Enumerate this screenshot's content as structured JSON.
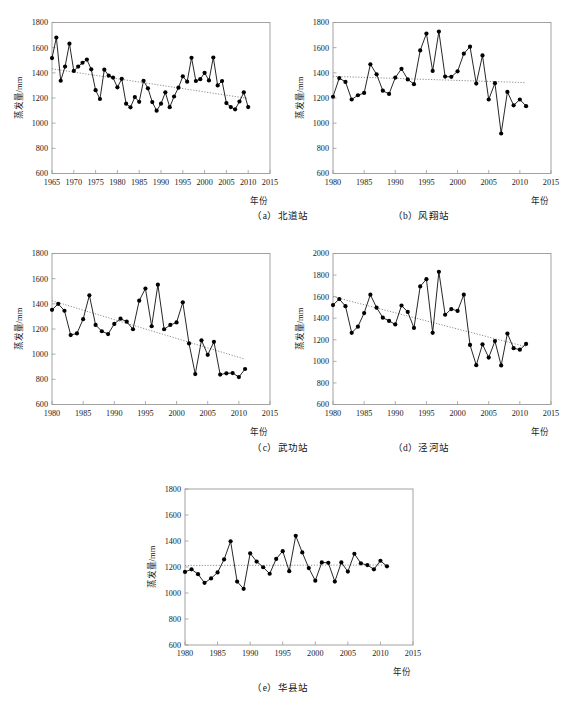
{
  "figure": {
    "axis_label_y": "蒸发量/mm",
    "axis_label_x": "年份",
    "marker_color": "#000000",
    "line_color": "#000000",
    "trend_color": "#808080",
    "axis_color": "#999999"
  },
  "captions": {
    "a": "（a）北道站",
    "b": "（b）风翔站",
    "c": "（c）武功站",
    "d": "（d）泾河站",
    "e": "（e）华县站"
  },
  "chart_data": [
    {
      "id": "a",
      "type": "line",
      "title": "（a）北道站",
      "station": "北道站",
      "xlabel": "年份",
      "ylabel": "蒸发量/mm",
      "xlim": [
        1965,
        2015
      ],
      "ylim": [
        600,
        1800
      ],
      "xticks": [
        1965,
        1970,
        1975,
        1980,
        1985,
        1990,
        1995,
        2000,
        2005,
        2010,
        2015
      ],
      "yticks": [
        600,
        800,
        1000,
        1200,
        1400,
        1600,
        1800
      ],
      "grid": false,
      "legend": "none",
      "trendline": {
        "type": "linear",
        "x": [
          1965,
          2010
        ],
        "y": [
          1432,
          1196
        ]
      },
      "x": [
        1965,
        1966,
        1967,
        1968,
        1969,
        1970,
        1971,
        1972,
        1973,
        1974,
        1975,
        1976,
        1977,
        1978,
        1979,
        1980,
        1981,
        1982,
        1983,
        1984,
        1985,
        1986,
        1987,
        1988,
        1989,
        1990,
        1991,
        1992,
        1993,
        1994,
        1995,
        1996,
        1997,
        1998,
        1999,
        2000,
        2001,
        2002,
        2003,
        2004,
        2005,
        2006,
        2007,
        2008,
        2009,
        2010
      ],
      "values": [
        1517,
        1680,
        1337,
        1450,
        1632,
        1415,
        1450,
        1480,
        1505,
        1428,
        1262,
        1192,
        1425,
        1378,
        1362,
        1285,
        1352,
        1155,
        1126,
        1207,
        1170,
        1337,
        1277,
        1168,
        1099,
        1155,
        1245,
        1127,
        1212,
        1282,
        1372,
        1330,
        1520,
        1335,
        1350,
        1400,
        1340,
        1522,
        1300,
        1335,
        1160,
        1128,
        1110,
        1172,
        1245,
        1128
      ]
    },
    {
      "id": "b",
      "type": "line",
      "title": "（b）风翔站",
      "station": "风翔站",
      "xlabel": "年份",
      "ylabel": "蒸发量/mm",
      "xlim": [
        1980,
        2015
      ],
      "ylim": [
        600,
        1800
      ],
      "xticks": [
        1980,
        1985,
        1990,
        1995,
        2000,
        2005,
        2010,
        2015
      ],
      "yticks": [
        600,
        800,
        1000,
        1200,
        1400,
        1600,
        1800
      ],
      "grid": false,
      "legend": "none",
      "trendline": {
        "type": "linear",
        "x": [
          1980,
          2011
        ],
        "y": [
          1372,
          1322
        ]
      },
      "x": [
        1980,
        1981,
        1982,
        1983,
        1984,
        1985,
        1986,
        1987,
        1988,
        1989,
        1990,
        1991,
        1992,
        1993,
        1994,
        1995,
        1996,
        1997,
        1998,
        1999,
        2000,
        2001,
        2002,
        2003,
        2004,
        2005,
        2006,
        2007,
        2008,
        2009,
        2010,
        2011
      ],
      "values": [
        1210,
        1358,
        1328,
        1188,
        1222,
        1240,
        1468,
        1388,
        1258,
        1232,
        1362,
        1432,
        1348,
        1310,
        1578,
        1712,
        1415,
        1728,
        1370,
        1368,
        1412,
        1552,
        1608,
        1315,
        1538,
        1188,
        1318,
        918,
        1248,
        1142,
        1188,
        1135
      ]
    },
    {
      "id": "c",
      "type": "line",
      "title": "（c）武功站",
      "station": "武功站",
      "xlabel": "年份",
      "ylabel": "蒸发量/mm",
      "xlim": [
        1980,
        2015
      ],
      "ylim": [
        600,
        1800
      ],
      "xticks": [
        1980,
        1985,
        1990,
        1995,
        2000,
        2005,
        2010,
        2015
      ],
      "yticks": [
        600,
        800,
        1000,
        1200,
        1400,
        1600,
        1800
      ],
      "grid": false,
      "legend": "none",
      "trendline": {
        "type": "linear",
        "x": [
          1980,
          2011
        ],
        "y": [
          1425,
          960
        ]
      },
      "x": [
        1980,
        1981,
        1982,
        1983,
        1984,
        1985,
        1986,
        1987,
        1988,
        1989,
        1990,
        1991,
        1992,
        1993,
        1994,
        1995,
        1996,
        1997,
        1998,
        1999,
        2000,
        2001,
        2002,
        2003,
        2004,
        2005,
        2006,
        2007,
        2008,
        2009,
        2010
      ],
      "values": [
        1352,
        1400,
        1345,
        1152,
        1165,
        1278,
        1468,
        1232,
        1182,
        1160,
        1240,
        1282,
        1258,
        1198,
        1425,
        1522,
        1222,
        1552,
        1198,
        1232,
        1252,
        1412,
        1085,
        842,
        1110,
        995,
        1098,
        838,
        848,
        850,
        818
      ],
      "extra_points": [
        {
          "x": 2011,
          "y": 882
        }
      ]
    },
    {
      "id": "d",
      "type": "line",
      "title": "（d）泾河站",
      "station": "泾河站",
      "xlabel": "年份",
      "ylabel": "蒸发量/mm",
      "xlim": [
        1980,
        2015
      ],
      "ylim": [
        600,
        2000
      ],
      "xticks": [
        1980,
        1985,
        1990,
        1995,
        2000,
        2005,
        2010,
        2015
      ],
      "yticks": [
        600,
        800,
        1000,
        1200,
        1400,
        1600,
        1800,
        2000
      ],
      "grid": false,
      "legend": "none",
      "trendline": {
        "type": "linear",
        "x": [
          1980,
          2011
        ],
        "y": [
          1600,
          1135
        ]
      },
      "x": [
        1980,
        1981,
        1982,
        1983,
        1984,
        1985,
        1986,
        1987,
        1988,
        1989,
        1990,
        1991,
        1992,
        1993,
        1994,
        1995,
        1996,
        1997,
        1998,
        1999,
        2000,
        2001,
        2002,
        2003,
        2004,
        2005,
        2006,
        2007,
        2008,
        2009,
        2010,
        2011
      ],
      "values": [
        1522,
        1578,
        1512,
        1265,
        1322,
        1448,
        1618,
        1498,
        1405,
        1375,
        1342,
        1518,
        1458,
        1310,
        1695,
        1762,
        1265,
        1830,
        1432,
        1485,
        1468,
        1618,
        1152,
        965,
        1158,
        1035,
        1188,
        962,
        1258,
        1122,
        1108,
        1162
      ]
    },
    {
      "id": "e",
      "type": "line",
      "title": "（e）华县站",
      "station": "华县站",
      "xlabel": "年份",
      "ylabel": "蒸发量/mm",
      "xlim": [
        1980,
        2015
      ],
      "ylim": [
        600,
        1800
      ],
      "xticks": [
        1980,
        1985,
        1990,
        1995,
        2000,
        2005,
        2010,
        2015
      ],
      "yticks": [
        600,
        800,
        1000,
        1200,
        1400,
        1600,
        1800
      ],
      "grid": false,
      "legend": "none",
      "trendline": {
        "type": "linear",
        "x": [
          1980,
          2011
        ],
        "y": [
          1212,
          1215
        ]
      },
      "x": [
        1980,
        1981,
        1982,
        1983,
        1984,
        1985,
        1986,
        1987,
        1988,
        1989,
        1990,
        1991,
        1992,
        1993,
        1994,
        1995,
        1996,
        1997,
        1998,
        1999,
        2000,
        2001,
        2002,
        2003,
        2004,
        2005,
        2006,
        2007,
        2008,
        2009,
        2010,
        2011
      ],
      "values": [
        1162,
        1182,
        1145,
        1078,
        1112,
        1158,
        1258,
        1398,
        1088,
        1032,
        1305,
        1242,
        1198,
        1148,
        1262,
        1322,
        1168,
        1440,
        1312,
        1192,
        1095,
        1235,
        1232,
        1088,
        1235,
        1165,
        1302,
        1228,
        1215,
        1182,
        1248,
        1205
      ]
    }
  ]
}
